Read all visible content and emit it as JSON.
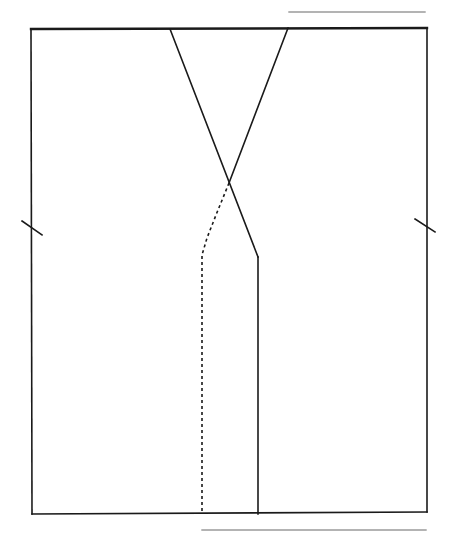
{
  "diagram": {
    "width": 461,
    "height": 538,
    "colors": {
      "background": "#ffffff",
      "stroke": "#1a1a1a",
      "rule": "#9a9a9a"
    },
    "top_rule": {
      "x1": 289,
      "y1": 12,
      "x2": 425,
      "y2": 12
    },
    "bottom_rule": {
      "x1": 202,
      "y1": 530,
      "x2": 426,
      "y2": 530
    },
    "frame": {
      "top": {
        "x1": 31,
        "y1": 29,
        "x2": 427,
        "y2": 28
      },
      "right": {
        "x1": 427,
        "y1": 28,
        "x2": 427,
        "y2": 512
      },
      "bottom": {
        "x1": 427,
        "y1": 512,
        "x2": 32,
        "y2": 514
      },
      "left": {
        "x1": 32,
        "y1": 514,
        "x2": 31,
        "y2": 29
      }
    },
    "cross_lines": {
      "left_diagonal": {
        "x1": 170,
        "y1": 29,
        "x2": 258,
        "y2": 257
      },
      "right_diagonal": {
        "x1": 288,
        "y1": 28,
        "x2": 229,
        "y2": 183
      }
    },
    "solid_vertical": {
      "x1": 258,
      "y1": 257,
      "x2": 258,
      "y2": 514
    },
    "dashed_path": {
      "points": "229,183 216,215 207,238 202,255 202,511",
      "dasharray": "3,3"
    },
    "tick_marks": {
      "left": {
        "x1": 22,
        "y1": 221,
        "x2": 42,
        "y2": 235
      },
      "right": {
        "x1": 415,
        "y1": 219,
        "x2": 435,
        "y2": 232
      }
    }
  }
}
